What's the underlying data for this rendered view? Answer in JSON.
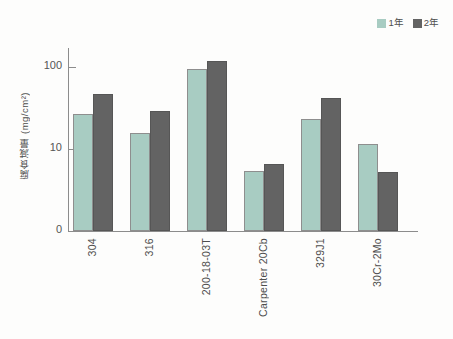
{
  "chart_data": {
    "type": "bar",
    "title": "",
    "xlabel": "",
    "ylabel": "腐食減量 (mg/cm²)",
    "yscale": "log",
    "ylim": [
      1,
      200
    ],
    "yticks": [
      "0",
      "10",
      "100"
    ],
    "grid": false,
    "legend_position": "top-right",
    "categories": [
      "304",
      "316",
      "200-18-03T",
      "Carpenter 20Cb",
      "329J1",
      "30Cr-2Mo"
    ],
    "series": [
      {
        "name": "1年",
        "color": "#a8ccc2",
        "values": [
          27,
          15.5,
          95,
          5.4,
          23,
          11.5
        ]
      },
      {
        "name": "2年",
        "color": "#636363",
        "values": [
          47,
          29,
          117,
          6.6,
          42,
          5.3
        ]
      }
    ]
  },
  "legend": {
    "items": [
      {
        "label": "1年",
        "color": "#a8ccc2"
      },
      {
        "label": "2年",
        "color": "#636363"
      }
    ]
  },
  "axis": {
    "y_label": "腐食減量 (mg/cm²)",
    "y_ticks": [
      "100",
      "10",
      "0"
    ],
    "x_categories": [
      "304",
      "316",
      "200-18-03T",
      "Carpenter 20Cb",
      "329J1",
      "30Cr-2Mo"
    ]
  }
}
